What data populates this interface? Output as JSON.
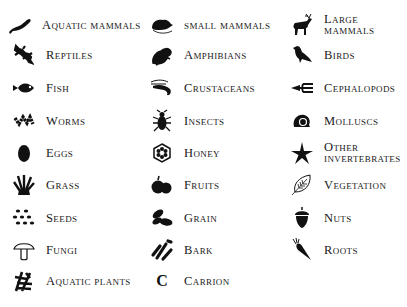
{
  "legend": {
    "columns": [
      {
        "items": [
          {
            "label": "Aquatic mammals",
            "icon": "seal-icon"
          },
          {
            "label": "Reptiles",
            "icon": "lizard-icon"
          },
          {
            "label": "Fish",
            "icon": "fish-icon"
          },
          {
            "label": "Worms",
            "icon": "worm-icon"
          },
          {
            "label": "Eggs",
            "icon": "egg-icon"
          },
          {
            "label": "Grass",
            "icon": "grass-icon"
          },
          {
            "label": "Seeds",
            "icon": "seeds-icon"
          },
          {
            "label": "Fungi",
            "icon": "mushroom-icon"
          },
          {
            "label": "Aquatic plants",
            "icon": "aquatic-plant-icon"
          }
        ]
      },
      {
        "items": [
          {
            "label": "small mammals",
            "icon": "rodent-icon"
          },
          {
            "label": "Amphibians",
            "icon": "frog-icon"
          },
          {
            "label": "Crustaceans",
            "icon": "shrimp-icon"
          },
          {
            "label": "Insects",
            "icon": "beetle-icon"
          },
          {
            "label": "Honey",
            "icon": "honeycomb-icon"
          },
          {
            "label": "Fruits",
            "icon": "fruit-icon"
          },
          {
            "label": "Grain",
            "icon": "grain-icon"
          },
          {
            "label": "Bark",
            "icon": "bark-icon"
          },
          {
            "label": "Carrion",
            "icon": "carrion-letter-icon",
            "glyph": "C"
          }
        ]
      },
      {
        "items": [
          {
            "label": "Large mammals",
            "icon": "deer-icon"
          },
          {
            "label": "Birds",
            "icon": "bird-icon"
          },
          {
            "label": "Cephalopods",
            "icon": "squid-icon"
          },
          {
            "label": "Molluscs",
            "icon": "snail-shell-icon"
          },
          {
            "label_line1": "Other",
            "label_line2": "invertebrates",
            "icon": "starfish-icon"
          },
          {
            "label": "Vegetation",
            "icon": "leaf-icon"
          },
          {
            "label": "Nuts",
            "icon": "acorn-icon"
          },
          {
            "label": "Roots",
            "icon": "carrot-icon"
          }
        ]
      }
    ]
  }
}
